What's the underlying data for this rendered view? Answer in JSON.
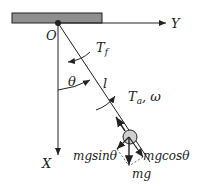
{
  "diagram": {
    "labels": {
      "origin": "O",
      "y_axis": "Y",
      "x_axis": "X",
      "friction_torque": "T",
      "friction_sub": "f",
      "applied_torque": "T",
      "applied_sub": "a",
      "omega": ", ω",
      "length": "l",
      "theta": "θ",
      "mg_sin": "mgsinθ",
      "mg_cos": "mgcosθ",
      "mg": "mg"
    },
    "colors": {
      "ceiling": "#8f8f8f",
      "line": "#222222",
      "bob": "#cfcfcf"
    }
  }
}
